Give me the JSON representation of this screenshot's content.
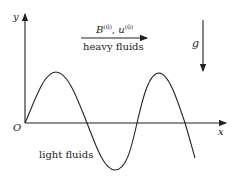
{
  "diagram": {
    "axes": {
      "x_label": "x",
      "y_label": "y",
      "origin_label": "O"
    },
    "flow_arrow": {
      "label_top_B": "B",
      "label_top_B_sup": "(0)",
      "label_top_sep": ", ",
      "label_top_u": "u",
      "label_top_u_sup": "(0)",
      "label_bottom": "heavy fluids"
    },
    "gravity_arrow": {
      "label": "g"
    },
    "lower_region_label": "light fluids",
    "colors": {
      "stroke": "#222222",
      "background": "#ffffff"
    }
  }
}
